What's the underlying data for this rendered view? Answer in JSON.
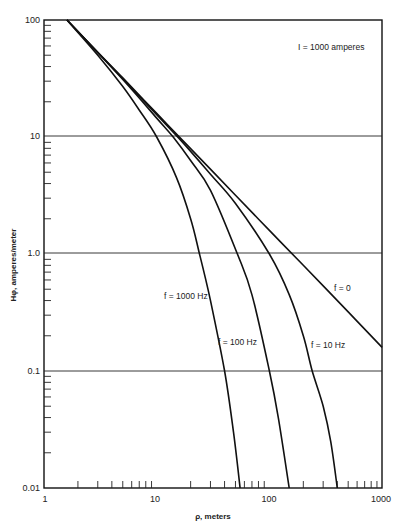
{
  "chart_data": {
    "type": "line",
    "title": "",
    "annotation": "I = 1000 amperes",
    "xlabel": "ρ, meters",
    "ylabel": "Hφ, amperes/meter",
    "xscale": "log",
    "yscale": "log",
    "xlim": [
      1,
      1000
    ],
    "ylim": [
      0.01,
      100
    ],
    "x_ticks": [
      1,
      10,
      100,
      1000
    ],
    "x_tick_labels": [
      "1",
      "10",
      "100",
      "1000"
    ],
    "y_ticks": [
      0.01,
      0.1,
      1.0,
      10,
      100
    ],
    "y_tick_labels": [
      "0.01",
      "0.1",
      "1.0",
      "10",
      "100"
    ],
    "grid": "horizontal lines at decades",
    "legend": "none (inline curve labels)",
    "series": [
      {
        "name": "f = 0",
        "label": "f = 0",
        "points": [
          [
            1.6,
            100
          ],
          [
            3,
            53
          ],
          [
            5,
            32
          ],
          [
            10,
            15.9
          ],
          [
            20,
            7.96
          ],
          [
            50,
            3.18
          ],
          [
            100,
            1.59
          ],
          [
            200,
            0.8
          ],
          [
            500,
            0.32
          ],
          [
            1000,
            0.159
          ]
        ],
        "label_pos": [
          510,
          0.3
        ]
      },
      {
        "name": "f = 10 Hz",
        "label": "f = 10 Hz",
        "points": [
          [
            1.6,
            100
          ],
          [
            5,
            31.5
          ],
          [
            10,
            15.5
          ],
          [
            17,
            9.0
          ],
          [
            30,
            4.8
          ],
          [
            50,
            2.7
          ],
          [
            100,
            1.0
          ],
          [
            150,
            0.45
          ],
          [
            200,
            0.2
          ],
          [
            240,
            0.1
          ],
          [
            300,
            0.05
          ],
          [
            350,
            0.025
          ],
          [
            400,
            0.01
          ]
        ],
        "label_pos": [
          240,
          0.155
        ]
      },
      {
        "name": "f = 100 Hz",
        "label": "f = 100 Hz",
        "points": [
          [
            1.6,
            100
          ],
          [
            5,
            31
          ],
          [
            10,
            14.5
          ],
          [
            14,
            10
          ],
          [
            20,
            6.3
          ],
          [
            30,
            3.5
          ],
          [
            52,
            1.0
          ],
          [
            70,
            0.45
          ],
          [
            100,
            0.1
          ],
          [
            120,
            0.04
          ],
          [
            150,
            0.01
          ]
        ],
        "label_pos": [
          38,
          0.155
        ]
      },
      {
        "name": "f = 1000 Hz",
        "label": "f = 1000 Hz",
        "points": [
          [
            1.6,
            100
          ],
          [
            3,
            50
          ],
          [
            5,
            27
          ],
          [
            7,
            17
          ],
          [
            10,
            10
          ],
          [
            15,
            4.5
          ],
          [
            20,
            2.0
          ],
          [
            24,
            1.0
          ],
          [
            30,
            0.4
          ],
          [
            40,
            0.1
          ],
          [
            48,
            0.03
          ],
          [
            55,
            0.01
          ]
        ],
        "label_pos": [
          12,
          0.42
        ]
      }
    ]
  },
  "labels": {
    "annotation": "I = 1000 amperes",
    "xlabel": "ρ, meters",
    "ylabel": "Hφ, amperes/meter",
    "f0": "f = 0",
    "f10": "f = 10 Hz",
    "f100": "f = 100 Hz",
    "f1000": "f = 1000 Hz",
    "x_ticks": [
      "1",
      "10",
      "100",
      "1000"
    ],
    "y_ticks": [
      "100",
      "10",
      "1.0",
      "0.1",
      "0.01"
    ]
  }
}
